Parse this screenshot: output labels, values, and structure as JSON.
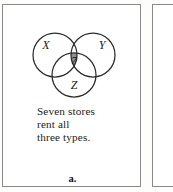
{
  "figure": {
    "label": "a.",
    "panel_border_color": "#8a8a8a",
    "background_color": "#ffffff"
  },
  "venn": {
    "type": "venn-3",
    "circle_stroke_color": "#2b2b2b",
    "shaded_region_color": "#8f8f8f",
    "sets": [
      {
        "id": "X",
        "label": "X",
        "cx": 52,
        "cy": 40,
        "r": 22
      },
      {
        "id": "Y",
        "label": "Y",
        "cx": 90,
        "cy": 40,
        "r": 22
      },
      {
        "id": "Z",
        "label": "Z",
        "cx": 71,
        "cy": 60,
        "r": 22
      }
    ],
    "shaded_region": {
      "name": "triple-intersection",
      "sets": "X and Y and Z",
      "value": "7",
      "fill": "#8f8f8f"
    }
  },
  "caption": {
    "lines": [
      "Seven stores",
      "rent all",
      "three types."
    ]
  }
}
